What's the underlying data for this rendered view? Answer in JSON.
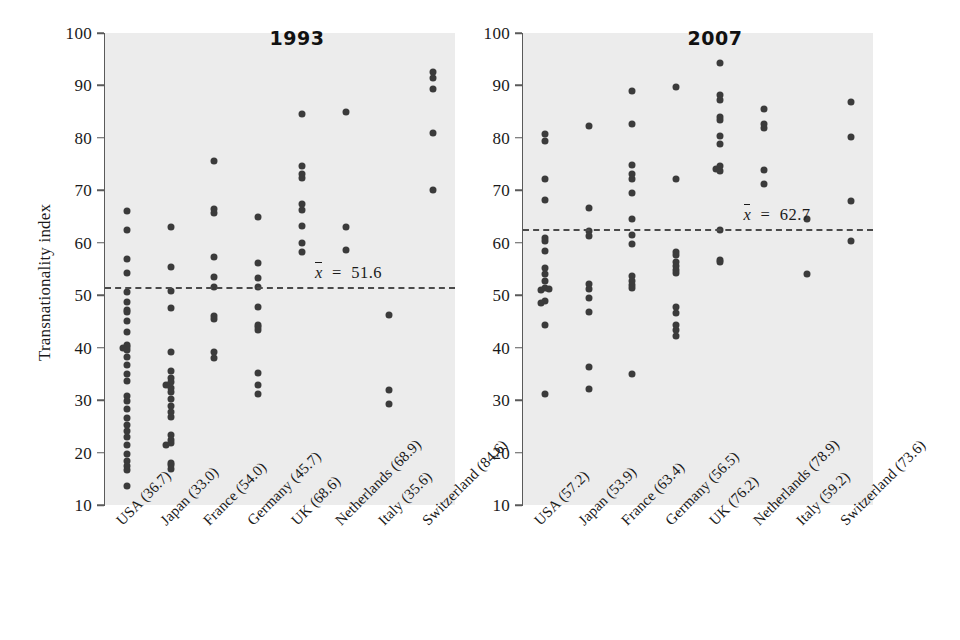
{
  "figure": {
    "ylabel": "Transnationality index",
    "yticks": [
      10,
      20,
      30,
      40,
      50,
      60,
      70,
      80,
      90,
      100
    ],
    "ylim": [
      10,
      100
    ]
  },
  "chart_data": [
    {
      "type": "scatter",
      "title": "1993",
      "xlabel": "",
      "ylabel": "Transnationality index",
      "ylim": [
        10,
        100
      ],
      "yticks": [
        10,
        20,
        30,
        40,
        50,
        60,
        70,
        80,
        90,
        100
      ],
      "grid": false,
      "legend": null,
      "mean_line": {
        "value": 62.7,
        "label": "x̄  =  51.6",
        "display_value": "51.6",
        "style": "dashed"
      },
      "categories": [
        "USA (36.7)",
        "Japan (33.0)",
        "France (54.0)",
        "Germany (45.7)",
        "UK (68.6)",
        "Netherlands (68.9)",
        "Italy (35.6)",
        "Switzerland (84.6)"
      ],
      "category_means": [
        36.7,
        33.0,
        54.0,
        45.7,
        68.6,
        68.9,
        35.6,
        84.6
      ],
      "series": [
        {
          "name": "USA (36.7)",
          "values": [
            66.0,
            62.5,
            57.0,
            54.3,
            50.6,
            48.8,
            47.2,
            46.8,
            45.0,
            43.0,
            40.6,
            40.2,
            40.0,
            39.6,
            38.2,
            36.6,
            35.0,
            33.6,
            30.7,
            29.8,
            28.3,
            26.6,
            25.2,
            24.2,
            23.0,
            21.5,
            19.7,
            18.4,
            17.4,
            16.6,
            13.6
          ]
        },
        {
          "name": "Japan (33.0)",
          "values": [
            63.0,
            55.4,
            50.9,
            47.6,
            39.2,
            35.5,
            34.2,
            33.4,
            33.0,
            32.4,
            31.5,
            30.2,
            28.8,
            27.7,
            26.8,
            23.4,
            22.4,
            21.9,
            21.6,
            18.1,
            17.7,
            16.8
          ]
        },
        {
          "name": "France (54.0)",
          "values": [
            75.6,
            66.5,
            65.6,
            57.2,
            53.5,
            51.6,
            46.1,
            45.4,
            39.1,
            38.0
          ]
        },
        {
          "name": "Germany (45.7)",
          "values": [
            65.0,
            56.1,
            53.2,
            51.6,
            47.7,
            44.4,
            44.0,
            43.4,
            35.2,
            32.8,
            31.2
          ]
        },
        {
          "name": "UK (68.6)",
          "values": [
            84.5,
            74.7,
            73.2,
            72.4,
            67.3,
            66.3,
            63.2,
            60.0,
            58.3
          ]
        },
        {
          "name": "Netherlands (68.9)",
          "values": [
            85.0,
            63.0,
            58.6
          ]
        },
        {
          "name": "Italy (35.6)",
          "values": [
            46.2,
            31.9,
            29.3
          ]
        },
        {
          "name": "Switzerland (84.6)",
          "values": [
            92.5,
            91.5,
            89.4,
            81.0,
            70.0
          ]
        }
      ]
    },
    {
      "type": "scatter",
      "title": "2007",
      "xlabel": "",
      "ylabel": "",
      "ylim": [
        10,
        100
      ],
      "yticks": [
        10,
        20,
        30,
        40,
        50,
        60,
        70,
        80,
        90,
        100
      ],
      "grid": false,
      "legend": null,
      "mean_line": {
        "value": 62.7,
        "label": "x̄  =  62.7",
        "display_value": "62.7",
        "style": "dashed"
      },
      "categories": [
        "USA (57.2)",
        "Japan (53.9)",
        "France (63.4)",
        "Germany (56.5)",
        "UK (76.2)",
        "Netherlands (78.9)",
        "Italy (59.2)",
        "Switzerland (73.6)"
      ],
      "category_means": [
        57.2,
        53.9,
        63.4,
        56.5,
        76.2,
        78.9,
        59.2,
        73.6
      ],
      "series": [
        {
          "name": "USA (57.2)",
          "values": [
            80.8,
            79.5,
            72.2,
            68.2,
            61.0,
            60.3,
            58.4,
            55.2,
            54.0,
            52.8,
            51.3,
            51.2,
            51.0,
            48.9,
            48.6,
            44.4,
            31.2
          ]
        },
        {
          "name": "Japan (53.9)",
          "values": [
            82.2,
            66.6,
            62.3,
            61.2,
            52.2,
            51.2,
            49.5,
            46.8,
            36.3,
            32.1
          ]
        },
        {
          "name": "France (63.4)",
          "values": [
            88.9,
            82.7,
            74.8,
            73.2,
            72.1,
            69.4,
            64.6,
            61.4,
            59.7,
            53.6,
            52.8,
            51.9,
            51.4,
            34.9
          ]
        },
        {
          "name": "Germany (56.5)",
          "values": [
            89.7,
            72.1,
            58.2,
            57.6,
            56.3,
            55.6,
            54.9,
            54.2,
            47.8,
            46.6,
            44.3,
            43.4,
            42.2
          ]
        },
        {
          "name": "UK (76.2)",
          "values": [
            94.3,
            88.2,
            87.2,
            83.4,
            83.9,
            80.4,
            78.8,
            74.6,
            74.3,
            73.6,
            62.4,
            56.4,
            56.7
          ]
        },
        {
          "name": "Netherlands (78.9)",
          "values": [
            85.5,
            82.6,
            81.8,
            73.9,
            71.3
          ]
        },
        {
          "name": "Italy (59.2)",
          "values": [
            64.6,
            54.0
          ]
        },
        {
          "name": "Switzerland (73.6)",
          "values": [
            86.8,
            80.2,
            68.0,
            60.3
          ]
        }
      ]
    }
  ]
}
